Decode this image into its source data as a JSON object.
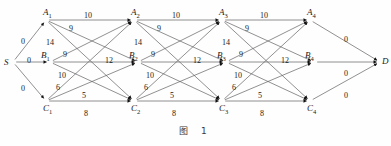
{
  "figure": {
    "caption": "图 1",
    "type": "layered-network-diagram"
  },
  "chart_data": {
    "type": "diagram",
    "title": "图 1",
    "layout": "left-to-right layered graph, 3 rows (A top, B middle, C bottom), 4 stage columns",
    "source": "S",
    "sink": "D",
    "rows": [
      "A",
      "B",
      "C"
    ],
    "stages": 4,
    "nodes": [
      {
        "id": "S",
        "label": "S",
        "sub": "",
        "x": 13,
        "y": 62
      },
      {
        "id": "A1",
        "label": "A",
        "sub": "1",
        "x": 46,
        "y": 20
      },
      {
        "id": "B1",
        "label": "B",
        "sub": "1",
        "x": 50,
        "y": 62
      },
      {
        "id": "C1",
        "label": "C",
        "sub": "1",
        "x": 46,
        "y": 101
      },
      {
        "id": "A2",
        "label": "A",
        "sub": "2",
        "x": 134,
        "y": 20
      },
      {
        "id": "B2",
        "label": "B",
        "sub": "2",
        "x": 138,
        "y": 62
      },
      {
        "id": "C2",
        "label": "C",
        "sub": "2",
        "x": 134,
        "y": 101
      },
      {
        "id": "A3",
        "label": "A",
        "sub": "3",
        "x": 222,
        "y": 20
      },
      {
        "id": "B3",
        "label": "B",
        "sub": "3",
        "x": 226,
        "y": 62
      },
      {
        "id": "C3",
        "label": "C",
        "sub": "3",
        "x": 222,
        "y": 101
      },
      {
        "id": "A4",
        "label": "A",
        "sub": "4",
        "x": 310,
        "y": 20
      },
      {
        "id": "B4",
        "label": "B",
        "sub": "4",
        "x": 314,
        "y": 62
      },
      {
        "id": "C4",
        "label": "C",
        "sub": "4",
        "x": 310,
        "y": 101
      },
      {
        "id": "D",
        "label": "D",
        "sub": "",
        "x": 380,
        "y": 62
      }
    ],
    "edges": [
      {
        "from": "S",
        "to": "A1",
        "weight": "0"
      },
      {
        "from": "S",
        "to": "B1",
        "weight": "0"
      },
      {
        "from": "S",
        "to": "C1",
        "weight": "0"
      },
      {
        "from": "A1",
        "to": "A2",
        "weight": "10"
      },
      {
        "from": "A1",
        "to": "B2",
        "weight": "9"
      },
      {
        "from": "A1",
        "to": "C2",
        "weight": "14"
      },
      {
        "from": "B1",
        "to": "A2",
        "weight": "9"
      },
      {
        "from": "B1",
        "to": "B2",
        "weight": "12"
      },
      {
        "from": "B1",
        "to": "C2",
        "weight": "10"
      },
      {
        "from": "C1",
        "to": "A2",
        "weight": "6"
      },
      {
        "from": "C1",
        "to": "B2",
        "weight": "5"
      },
      {
        "from": "C1",
        "to": "C2",
        "weight": "8"
      },
      {
        "from": "A2",
        "to": "A3",
        "weight": "10"
      },
      {
        "from": "A2",
        "to": "B3",
        "weight": "9"
      },
      {
        "from": "A2",
        "to": "C3",
        "weight": "14"
      },
      {
        "from": "B2",
        "to": "A3",
        "weight": "9"
      },
      {
        "from": "B2",
        "to": "B3",
        "weight": "12"
      },
      {
        "from": "B2",
        "to": "C3",
        "weight": "10"
      },
      {
        "from": "C2",
        "to": "A3",
        "weight": "6"
      },
      {
        "from": "C2",
        "to": "B3",
        "weight": "5"
      },
      {
        "from": "C2",
        "to": "C3",
        "weight": "8"
      },
      {
        "from": "A3",
        "to": "A4",
        "weight": "10"
      },
      {
        "from": "A3",
        "to": "B4",
        "weight": "9"
      },
      {
        "from": "A3",
        "to": "C4",
        "weight": "14"
      },
      {
        "from": "B3",
        "to": "A4",
        "weight": "9"
      },
      {
        "from": "B3",
        "to": "B4",
        "weight": "12"
      },
      {
        "from": "B3",
        "to": "C4",
        "weight": "10"
      },
      {
        "from": "C3",
        "to": "A4",
        "weight": "6"
      },
      {
        "from": "C3",
        "to": "B4",
        "weight": "5"
      },
      {
        "from": "C3",
        "to": "C4",
        "weight": "8"
      },
      {
        "from": "A4",
        "to": "D",
        "weight": "0"
      },
      {
        "from": "B4",
        "to": "D",
        "weight": "0"
      },
      {
        "from": "C4",
        "to": "D",
        "weight": "0"
      }
    ],
    "weight_labels": [
      {
        "text": "0",
        "x": 21,
        "y": 38
      },
      {
        "text": "0",
        "x": 27,
        "y": 57
      },
      {
        "text": "0",
        "x": 21,
        "y": 85
      },
      {
        "text": "10",
        "x": 84,
        "y": 12
      },
      {
        "text": "9",
        "x": 69,
        "y": 25
      },
      {
        "text": "14",
        "x": 46,
        "y": 39
      },
      {
        "text": "9",
        "x": 63,
        "y": 51
      },
      {
        "text": "12",
        "x": 105,
        "y": 57
      },
      {
        "text": "10",
        "x": 58,
        "y": 72
      },
      {
        "text": "6",
        "x": 56,
        "y": 84
      },
      {
        "text": "5",
        "x": 82,
        "y": 92
      },
      {
        "text": "8",
        "x": 84,
        "y": 110
      },
      {
        "text": "10",
        "x": 172,
        "y": 12
      },
      {
        "text": "9",
        "x": 157,
        "y": 25
      },
      {
        "text": "14",
        "x": 134,
        "y": 39
      },
      {
        "text": "9",
        "x": 151,
        "y": 51
      },
      {
        "text": "12",
        "x": 193,
        "y": 57
      },
      {
        "text": "10",
        "x": 146,
        "y": 72
      },
      {
        "text": "6",
        "x": 144,
        "y": 84
      },
      {
        "text": "5",
        "x": 170,
        "y": 92
      },
      {
        "text": "8",
        "x": 172,
        "y": 110
      },
      {
        "text": "10",
        "x": 260,
        "y": 12
      },
      {
        "text": "9",
        "x": 245,
        "y": 25
      },
      {
        "text": "14",
        "x": 222,
        "y": 39
      },
      {
        "text": "9",
        "x": 239,
        "y": 51
      },
      {
        "text": "12",
        "x": 281,
        "y": 57
      },
      {
        "text": "10",
        "x": 234,
        "y": 72
      },
      {
        "text": "6",
        "x": 232,
        "y": 84
      },
      {
        "text": "5",
        "x": 258,
        "y": 92
      },
      {
        "text": "8",
        "x": 260,
        "y": 110
      },
      {
        "text": "0",
        "x": 344,
        "y": 36
      },
      {
        "text": "0",
        "x": 344,
        "y": 70
      },
      {
        "text": "0",
        "x": 344,
        "y": 92
      }
    ]
  }
}
